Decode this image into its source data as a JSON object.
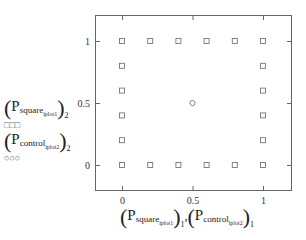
{
  "chart_data": {
    "type": "scatter",
    "title": "",
    "xlabel": "(P_square_iplot1)_1 , (P_control_iplot2)_1",
    "ylabel": "",
    "xlim": [
      -0.38,
      1.4
    ],
    "ylim": [
      -0.2,
      1.2
    ],
    "x_ticks": [
      0,
      0.5,
      1
    ],
    "x_tick_labels": [
      "0",
      "0.5",
      "1"
    ],
    "y_ticks": [
      0,
      0.5,
      1
    ],
    "y_tick_labels": [
      "0",
      "0.5",
      "1"
    ],
    "grid": false,
    "legend_position": "left",
    "series": [
      {
        "name": "(P_square_iplot1)_2",
        "marker": "square",
        "color": "#777777",
        "x": [
          0,
          0.2,
          0.4,
          0.6,
          0.8,
          1,
          0,
          1,
          0,
          1,
          0,
          1,
          0,
          1,
          0,
          0.2,
          0.4,
          0.6,
          0.8,
          1
        ],
        "y": [
          1,
          1,
          1,
          1,
          1,
          1,
          0.8,
          0.8,
          0.6,
          0.6,
          0.4,
          0.4,
          0.2,
          0.2,
          0,
          0,
          0,
          0,
          0,
          0
        ]
      },
      {
        "name": "(P_control_iplot2)_2",
        "marker": "circle",
        "color": "#777777",
        "x": [
          0.5
        ],
        "y": [
          0.5
        ]
      }
    ]
  },
  "legend": {
    "items": [
      {
        "P": "P",
        "sub": "square",
        "subsub": "iplot1",
        "outsub": "2",
        "markers": "□□□"
      },
      {
        "P": "P",
        "sub": "control",
        "subsub": "iplot2",
        "outsub": "2",
        "markers": "○○○"
      }
    ]
  },
  "xaxis_label": {
    "left": {
      "P": "P",
      "sub": "square",
      "subsub": "iplot1",
      "outsub": "1"
    },
    "sep": ",",
    "right": {
      "P": "P",
      "sub": "control",
      "subsub": "iplot2",
      "outsub": "1"
    }
  }
}
